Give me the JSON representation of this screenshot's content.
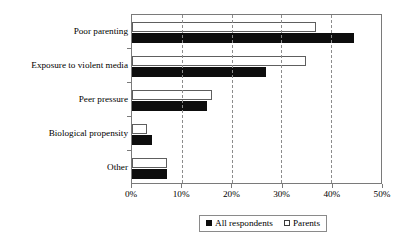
{
  "chart_data": {
    "type": "bar",
    "orientation": "horizontal",
    "title": "",
    "subtitle": "",
    "xlabel": "",
    "ylabel": "",
    "xlim": [
      0,
      50
    ],
    "xtick_labels": [
      "0%",
      "10%",
      "20%",
      "30%",
      "40%",
      "50%"
    ],
    "xtick_values": [
      0,
      10,
      20,
      30,
      40,
      50
    ],
    "grid": "vertical-dashed",
    "legend_position": "bottom-center",
    "categories": [
      "Poor parenting",
      "Exposure to violent media",
      "Peer pressure",
      "Biological propensity",
      "Other"
    ],
    "series": [
      {
        "name": "All respondents",
        "color": "#0d0d0d",
        "swatch": "filled-square",
        "values": [
          44.5,
          27.0,
          15.0,
          4.0,
          7.0
        ]
      },
      {
        "name": "Parents",
        "color": "#ffffff",
        "swatch": "open-square",
        "values": [
          37.0,
          35.0,
          16.0,
          3.0,
          7.0
        ]
      }
    ]
  },
  "legend": {
    "entries": [
      {
        "label": "All respondents",
        "swatch": "filled-square"
      },
      {
        "label": "Parents",
        "swatch": "open-square"
      }
    ]
  },
  "colors": {
    "all_respondents": "#0d0d0d",
    "parents": "#ffffff",
    "axis": "#7a7a7a",
    "grid": "#8c8c8c",
    "text": "#000000"
  }
}
